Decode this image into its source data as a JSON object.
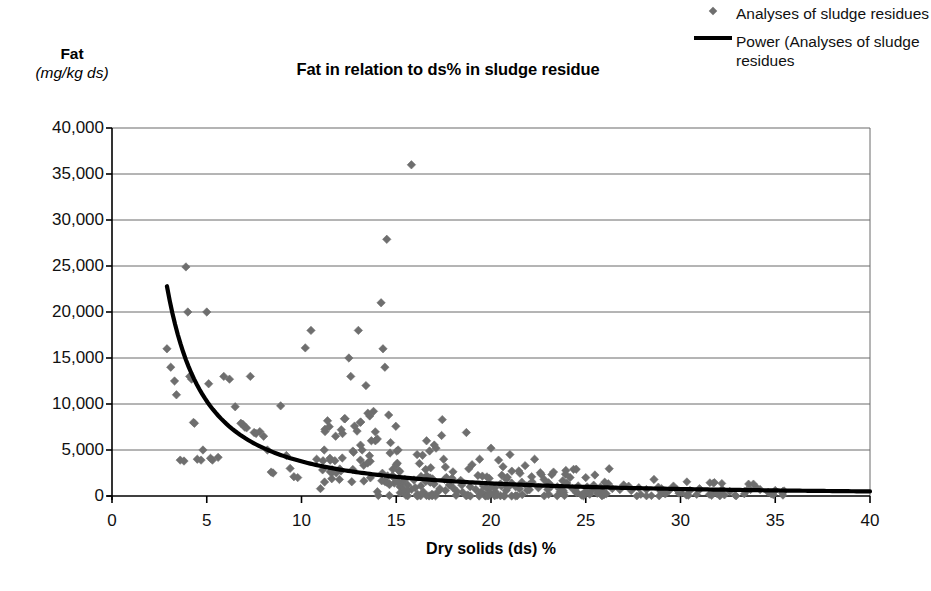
{
  "chart_data": {
    "type": "scatter",
    "title": "Fat in relation to ds% in sludge residue",
    "xlabel": "Dry solids (ds) %",
    "ylabel": "Fat",
    "ylabel_units": "(mg/kg ds)",
    "xlim": [
      0,
      40
    ],
    "ylim": [
      0,
      40000
    ],
    "xticks": [
      0,
      5,
      10,
      15,
      20,
      25,
      30,
      35,
      40
    ],
    "xtick_labels": [
      "0",
      "5",
      "10",
      "15",
      "20",
      "25",
      "30",
      "35",
      "40"
    ],
    "yticks": [
      0,
      5000,
      10000,
      15000,
      20000,
      25000,
      30000,
      35000,
      40000
    ],
    "ytick_labels": [
      "0",
      "5,000",
      "10,000",
      "15,000",
      "20,000",
      "25,000",
      "30,000",
      "35,000",
      "40,000"
    ],
    "grid": "horizontal",
    "legend_position": "top-right",
    "marker_color": "#6e6e6e",
    "marker_shape": "diamond",
    "trendline_color": "#000000",
    "series": [
      {
        "name": "Analyses of sludge residues",
        "type": "scatter",
        "points": [
          [
            2.9,
            16000
          ],
          [
            3.1,
            14000
          ],
          [
            3.3,
            12500
          ],
          [
            3.4,
            11000
          ],
          [
            3.6,
            3900
          ],
          [
            3.8,
            3800
          ],
          [
            3.9,
            24900
          ],
          [
            4.0,
            20000
          ],
          [
            4.1,
            13000
          ],
          [
            4.2,
            12700
          ],
          [
            4.3,
            8000
          ],
          [
            4.35,
            7900
          ],
          [
            4.5,
            4000
          ],
          [
            4.7,
            3900
          ],
          [
            4.8,
            5000
          ],
          [
            5.0,
            20000
          ],
          [
            5.1,
            12200
          ],
          [
            5.2,
            4100
          ],
          [
            5.3,
            3900
          ],
          [
            5.6,
            4200
          ],
          [
            5.9,
            13000
          ],
          [
            6.2,
            12700
          ],
          [
            6.5,
            9700
          ],
          [
            6.8,
            7900
          ],
          [
            6.9,
            7800
          ],
          [
            7.0,
            7500
          ],
          [
            7.1,
            7400
          ],
          [
            7.3,
            13000
          ],
          [
            7.5,
            6900
          ],
          [
            7.6,
            6800
          ],
          [
            7.8,
            7000
          ],
          [
            8.0,
            6500
          ],
          [
            8.2,
            5000
          ],
          [
            8.4,
            2600
          ],
          [
            8.5,
            2500
          ],
          [
            8.9,
            9800
          ],
          [
            9.2,
            4400
          ],
          [
            9.4,
            3000
          ],
          [
            9.6,
            2100
          ],
          [
            9.8,
            2000
          ],
          [
            10.2,
            16100
          ],
          [
            10.5,
            18000
          ],
          [
            10.8,
            4000
          ],
          [
            11.0,
            800
          ],
          [
            11.2,
            5000
          ],
          [
            11.5,
            4100
          ],
          [
            11.8,
            6500
          ],
          [
            12.0,
            1800
          ],
          [
            12.1,
            7200
          ],
          [
            12.3,
            8400
          ],
          [
            12.5,
            15000
          ],
          [
            12.6,
            13000
          ],
          [
            12.8,
            7600
          ],
          [
            13.0,
            18000
          ],
          [
            13.1,
            8000
          ],
          [
            13.2,
            5000
          ],
          [
            13.4,
            12000
          ],
          [
            13.5,
            9000
          ],
          [
            13.6,
            8700
          ],
          [
            13.8,
            9200
          ],
          [
            13.9,
            6000
          ],
          [
            14.0,
            6200
          ],
          [
            14.2,
            21000
          ],
          [
            14.3,
            16000
          ],
          [
            14.4,
            14000
          ],
          [
            14.5,
            27900
          ],
          [
            14.6,
            8800
          ],
          [
            14.7,
            5800
          ],
          [
            14.8,
            2200
          ],
          [
            14.9,
            1400
          ],
          [
            15.0,
            3400
          ],
          [
            15.1,
            5000
          ],
          [
            15.2,
            1000
          ],
          [
            15.4,
            700
          ],
          [
            15.6,
            1200
          ],
          [
            15.8,
            36000
          ],
          [
            16.0,
            900
          ],
          [
            16.1,
            4500
          ],
          [
            16.3,
            1100
          ],
          [
            16.5,
            2000
          ],
          [
            16.6,
            6000
          ],
          [
            16.8,
            1500
          ],
          [
            17.0,
            1300
          ],
          [
            17.1,
            5200
          ],
          [
            17.3,
            800
          ],
          [
            17.5,
            4000
          ],
          [
            17.6,
            600
          ],
          [
            17.8,
            1200
          ],
          [
            18.0,
            900
          ],
          [
            18.2,
            500
          ],
          [
            18.4,
            1700
          ],
          [
            18.5,
            400
          ],
          [
            18.7,
            6900
          ],
          [
            18.9,
            1000
          ],
          [
            19.0,
            3400
          ],
          [
            19.2,
            700
          ],
          [
            19.4,
            4000
          ],
          [
            19.6,
            1100
          ],
          [
            19.8,
            800
          ],
          [
            20.0,
            5200
          ],
          [
            20.2,
            900
          ],
          [
            20.4,
            3900
          ],
          [
            20.5,
            1300
          ],
          [
            20.8,
            600
          ],
          [
            21.0,
            4500
          ],
          [
            21.1,
            2700
          ],
          [
            21.3,
            1000
          ],
          [
            21.5,
            800
          ],
          [
            21.8,
            3300
          ],
          [
            22.0,
            1200
          ],
          [
            22.3,
            4000
          ],
          [
            22.5,
            900
          ],
          [
            22.8,
            1800
          ],
          [
            23.0,
            700
          ],
          [
            23.3,
            2600
          ],
          [
            23.5,
            1000
          ],
          [
            23.8,
            600
          ],
          [
            24.0,
            1400
          ],
          [
            24.3,
            800
          ],
          [
            24.6,
            1100
          ],
          [
            25.0,
            2000
          ],
          [
            25.2,
            700
          ],
          [
            25.5,
            900
          ],
          [
            25.8,
            600
          ],
          [
            26.0,
            1500
          ],
          [
            26.4,
            800
          ],
          [
            26.8,
            700
          ],
          [
            27.0,
            1200
          ],
          [
            27.4,
            600
          ],
          [
            27.8,
            900
          ],
          [
            28.2,
            700
          ],
          [
            28.6,
            1800
          ],
          [
            29.0,
            800
          ],
          [
            29.4,
            600
          ],
          [
            29.8,
            700
          ],
          [
            30.5,
            600
          ],
          [
            31.0,
            800
          ],
          [
            32.2,
            700
          ],
          [
            32.6,
            500
          ],
          [
            33.5,
            600
          ],
          [
            34.2,
            700
          ],
          [
            35.0,
            600
          ],
          [
            35.4,
            500
          ]
        ]
      }
    ],
    "trendline": {
      "name": "Power (Analyses of sludge residues",
      "type": "power",
      "x_start": 2.9,
      "x_end": 40.0,
      "y_start": 22800,
      "y_end": 500,
      "description": "Power regression curve decreasing from ~22,800 at ds 2.9% to ~500 at ds 40%"
    },
    "legend": [
      {
        "label": "Analyses of sludge residues",
        "key": "diamond-marker"
      },
      {
        "label": "Power (Analyses of sludge residues",
        "key": "line-marker"
      }
    ]
  }
}
